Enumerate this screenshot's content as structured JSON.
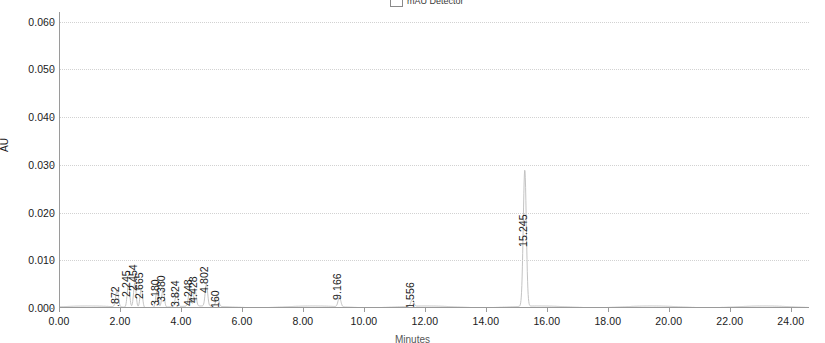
{
  "chart_data": {
    "type": "line",
    "title": "",
    "subtitle": "",
    "xlabel": "Minutes",
    "ylabel": "AU",
    "xlim": [
      0.0,
      24.6
    ],
    "ylim": [
      0.0,
      0.062
    ],
    "grid": true,
    "legend_position": "top-center",
    "legend_entries": [
      "mAU Detector"
    ],
    "x_ticks": [
      "0.00",
      "2.00",
      "4.00",
      "6.00",
      "8.00",
      "10.00",
      "12.00",
      "14.00",
      "16.00",
      "18.00",
      "20.00",
      "22.00",
      "24.00"
    ],
    "x_tick_values": [
      0,
      2,
      4,
      6,
      8,
      10,
      12,
      14,
      16,
      18,
      20,
      22,
      24
    ],
    "y_ticks": [
      "0.000",
      "0.010",
      "0.020",
      "0.030",
      "0.040",
      "0.050",
      "0.060"
    ],
    "y_tick_values": [
      0.0,
      0.01,
      0.02,
      0.03,
      0.04,
      0.05,
      0.06
    ],
    "series": [
      {
        "name": "mAU Detector",
        "peaks": [
          {
            "label": "1.872",
            "rt": 1.872,
            "height": 0.0035,
            "width": 0.1,
            "label_y": 0.0015
          },
          {
            "label": "2.245",
            "rt": 2.245,
            "height": 0.0048,
            "width": 0.09,
            "label_y": 0.0048
          },
          {
            "label": "2.454",
            "rt": 2.454,
            "height": 0.0052,
            "width": 0.09,
            "label_y": 0.006
          },
          {
            "label": "2.665",
            "rt": 2.665,
            "height": 0.004,
            "width": 0.09,
            "label_y": 0.0044
          },
          {
            "label": "3.180",
            "rt": 3.18,
            "height": 0.0034,
            "width": 0.09,
            "label_y": 0.003
          },
          {
            "label": "3.380",
            "rt": 3.38,
            "height": 0.0038,
            "width": 0.09,
            "label_y": 0.0038
          },
          {
            "label": "3.824",
            "rt": 3.824,
            "height": 0.0032,
            "width": 0.09,
            "label_y": 0.0028
          },
          {
            "label": "4.248",
            "rt": 4.248,
            "height": 0.003,
            "width": 0.09,
            "label_y": 0.003
          },
          {
            "label": "4.428",
            "rt": 4.428,
            "height": 0.0034,
            "width": 0.09,
            "label_y": 0.0036
          },
          {
            "label": "4.802",
            "rt": 4.802,
            "height": 0.0046,
            "width": 0.09,
            "label_y": 0.0056
          },
          {
            "label": "5.160",
            "rt": 5.16,
            "height": 0.0022,
            "width": 0.1,
            "label_y": 0.0006
          },
          {
            "label": "9.166",
            "rt": 9.166,
            "height": 0.002,
            "width": 0.1,
            "label_y": 0.0042
          },
          {
            "label": "11.556",
            "rt": 11.556,
            "height": 0.0015,
            "width": 0.1,
            "label_y": 0.0012
          },
          {
            "label": "15.245",
            "rt": 15.245,
            "height": 0.0285,
            "width": 0.11,
            "label_y": 0.0152
          }
        ]
      }
    ]
  }
}
